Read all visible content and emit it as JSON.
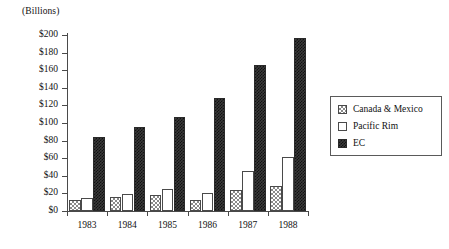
{
  "units_caption": "(Billions)",
  "legend": {
    "items": [
      {
        "label": "Canada & Mexico",
        "pattern": "crosshatch-gray",
        "color": "#8a8a8a"
      },
      {
        "label": "Pacific Rim",
        "pattern": "empty-white",
        "color": "#ffffff"
      },
      {
        "label": "EC",
        "pattern": "dense-dot-dark",
        "color": "#2f2f2f"
      }
    ]
  },
  "chart_data": {
    "type": "bar",
    "title": "",
    "subtitle": "",
    "xlabel": "",
    "ylabel": "(Billions)",
    "ylim": [
      0,
      200
    ],
    "ytick_values": [
      0,
      20,
      40,
      60,
      80,
      100,
      120,
      140,
      160,
      180,
      200
    ],
    "ytick_labels": [
      "$0",
      "$20",
      "$40",
      "$60",
      "$80",
      "$100",
      "$120",
      "$140",
      "$160",
      "$180",
      "$200"
    ],
    "categories": [
      "1983",
      "1984",
      "1985",
      "1986",
      "1987",
      "1988"
    ],
    "grid": false,
    "legend_position": "right",
    "series": [
      {
        "name": "Canada & Mexico",
        "values": [
          12,
          16,
          18,
          12,
          24,
          28
        ]
      },
      {
        "name": "Pacific Rim",
        "values": [
          15,
          19,
          25,
          21,
          45,
          61
        ]
      },
      {
        "name": "EC",
        "values": [
          84,
          96,
          107,
          128,
          166,
          197
        ]
      }
    ]
  }
}
